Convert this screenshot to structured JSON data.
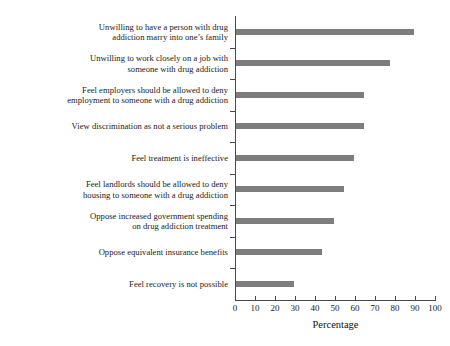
{
  "chart_data": {
    "type": "bar",
    "orientation": "horizontal",
    "title": "",
    "xlabel": "Percentage",
    "ylabel": "",
    "xlim": [
      0,
      100
    ],
    "xticks": [
      0,
      10,
      20,
      30,
      40,
      50,
      60,
      70,
      80,
      90,
      100
    ],
    "grid": false,
    "legend": null,
    "bar_color": "#7d7d7d",
    "axis_color": "#4a4a4a",
    "categories": [
      "Unwilling to have a person with drug\naddiction marry into one’s family",
      "Unwilling to work closely on a job with\nsomeone with drug addiction",
      "Feel employers should be allowed to deny\nemployment to someone with a drug addiction",
      "View discrimination as not a serious problem",
      "Feel treatment is ineffective",
      "Feel landlords should be allowed to deny\nhousing to someone with a drug addiction",
      "Oppose increased government spending\non drug addiction treatment",
      "Oppose equivalent insurance benefits",
      "Feel recovery is not possible"
    ],
    "values": [
      89,
      77,
      64,
      64,
      59,
      54,
      49,
      43,
      29
    ]
  }
}
